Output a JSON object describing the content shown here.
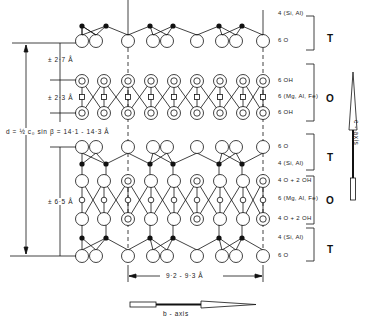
{
  "diagram": {
    "type": "2:1 layer silicate (chlorite-type) structure projection",
    "layer_labels": [
      {
        "text": "4 (Si, Al)",
        "group": "T"
      },
      {
        "text": "6 O",
        "group": "T"
      },
      {
        "text": "6 OH",
        "group": "O"
      },
      {
        "text": "6 (Mg, Al, Fe)",
        "group": "O"
      },
      {
        "text": "6 OH",
        "group": "O"
      },
      {
        "text": "6 O",
        "group": "T"
      },
      {
        "text": "4 (Si, Al)",
        "group": "T"
      },
      {
        "text": "4 O + 2 OH",
        "group": "O"
      },
      {
        "text": "6 (Mg, Al, Fe)",
        "group": "O"
      },
      {
        "text": "4 O + 2 OH",
        "group": "O"
      },
      {
        "text": "4 (Si, Al)",
        "group": "T"
      },
      {
        "text": "6 O",
        "group": "T"
      }
    ],
    "brackets": [
      "T",
      "O",
      "T",
      "O",
      "T"
    ],
    "dimensions": {
      "d_spacing": "d = ½ c₀ sin β = 14·1 - 14·3 Å",
      "interlayer": "± 2·7 Å",
      "brucite": "± 2·3 Å",
      "talc": "± 6·5 Å",
      "b_repeat": "9·2 - 9·3 Å"
    },
    "axes": {
      "c_axis": "c - axis",
      "b_axis": "b - axis"
    }
  }
}
